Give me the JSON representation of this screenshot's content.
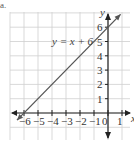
{
  "problem_marker": "a.",
  "chart_data": {
    "type": "line",
    "title": "",
    "xlabel": "x",
    "ylabel": "y",
    "xlim": [
      -7,
      1.8
    ],
    "ylim": [
      -2,
      7.2
    ],
    "grid": true,
    "x_ticks": [
      -6,
      -5,
      -4,
      -3,
      -2,
      -1,
      0,
      1
    ],
    "x_tick_labels": [
      "−6",
      "−5",
      "−4",
      "−3",
      "−2",
      "−1",
      "0",
      "1"
    ],
    "y_ticks": [
      1,
      2,
      3,
      4,
      5,
      6
    ],
    "y_tick_labels": [
      "1",
      "2",
      "3",
      "4",
      "5",
      "6"
    ],
    "series": [
      {
        "name": "y = x + 6",
        "equation": "y = x + 6",
        "slope": 1,
        "intercept": 6,
        "x": [
          -6.5,
          0.9
        ],
        "y": [
          -0.5,
          6.9
        ],
        "arrows": "both"
      }
    ],
    "annotations": [
      {
        "text": "y = x + 6",
        "x": -3.5,
        "y": 5.2
      }
    ],
    "colors": {
      "grid": "#cfcfcf",
      "axis": "#222222",
      "line": "#555555"
    }
  }
}
